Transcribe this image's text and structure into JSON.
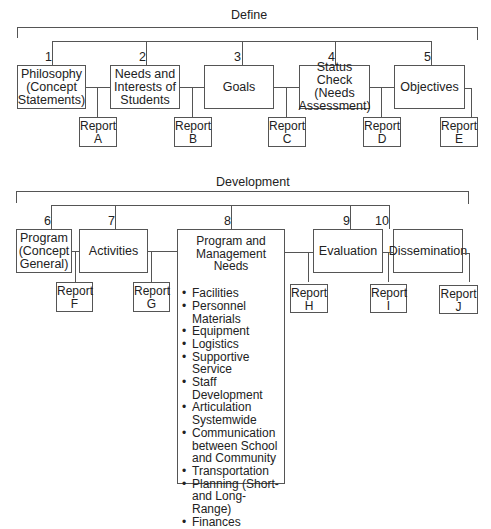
{
  "sections": {
    "define": {
      "title": "Define",
      "steps": [
        {
          "number": "1",
          "label": "Philosophy (Concept Statements)",
          "lines": [
            "Philosophy",
            "(Concept",
            "Statements)"
          ],
          "report": {
            "word": "Report",
            "letter": "A"
          }
        },
        {
          "number": "2",
          "label": "Needs and Interests of Students",
          "lines": [
            "Needs and",
            "Interests of",
            "Students"
          ],
          "report": {
            "word": "Report",
            "letter": "B"
          }
        },
        {
          "number": "3",
          "label": "Goals",
          "lines": [
            "Goals"
          ],
          "report": {
            "word": "Report",
            "letter": "C"
          }
        },
        {
          "number": "4",
          "label": "Status Check (Needs Assessment)",
          "lines": [
            "Status Check",
            "(Needs",
            "Assessment)"
          ],
          "report": {
            "word": "Report",
            "letter": "D"
          }
        },
        {
          "number": "5",
          "label": "Objectives",
          "lines": [
            "Objectives"
          ],
          "report": {
            "word": "Report",
            "letter": "E"
          }
        }
      ]
    },
    "development": {
      "title": "Development",
      "steps": [
        {
          "number": "6",
          "label": "Program (Concept General)",
          "lines": [
            "Program",
            "(Concept",
            "General)"
          ],
          "report": {
            "word": "Report",
            "letter": "F"
          }
        },
        {
          "number": "7",
          "label": "Activities",
          "lines": [
            "Activities"
          ],
          "report": {
            "word": "Report",
            "letter": "G"
          }
        },
        {
          "number": "8",
          "label": "Program and Management Needs",
          "lines": [
            "Program and",
            "Management",
            "Needs"
          ],
          "items": [
            "Facilities",
            "Personnel Materials",
            "Equipment",
            "Logistics",
            "Supportive Service",
            "Staff Development",
            "Articulation Systemwide",
            "Communication between School and Community",
            "Transportation",
            "Planning (Short- and Long-Range)",
            "Finances"
          ]
        },
        {
          "number": "9",
          "label": "Evaluation",
          "lines": [
            "Evaluation"
          ],
          "report": {
            "word": "Report",
            "letter": "H"
          }
        },
        {
          "number": "10",
          "label": "Dissemination",
          "lines": [
            "Dissemination"
          ],
          "report": {
            "word": "Report",
            "letter": "I"
          }
        },
        {
          "number": "",
          "label": "",
          "lines": [],
          "report": {
            "word": "Report",
            "letter": "J"
          }
        }
      ]
    }
  },
  "colors": {
    "line": "#555555",
    "text": "#222222",
    "background": "#ffffff"
  }
}
